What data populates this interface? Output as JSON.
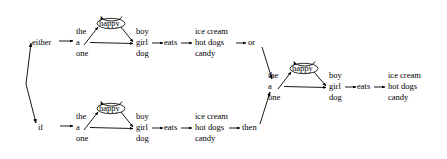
{
  "diagram": {
    "background_color": "#ffffff",
    "line_color": "#000000",
    "text_color": "#000000"
  },
  "nodes": {
    "either": {
      "label": "either"
    },
    "if": {
      "label": "if"
    },
    "branch1_det": {
      "words": [
        "the",
        "a",
        "one"
      ]
    },
    "branch1_adj": {
      "label": "happy"
    },
    "branch1_noun": {
      "words": [
        "boy",
        "girl",
        "dog"
      ]
    },
    "branch1_verb": {
      "label": "eats"
    },
    "branch1_obj": {
      "words": [
        "ice cream",
        "hot dogs",
        "candy"
      ]
    },
    "or": {
      "label": "or"
    },
    "branch2_det": {
      "words": [
        "the",
        "a",
        "one"
      ]
    },
    "branch2_adj": {
      "label": "happy"
    },
    "branch2_noun": {
      "words": [
        "boy",
        "girl",
        "dog"
      ]
    },
    "branch2_verb": {
      "label": "eats"
    },
    "branch2_obj": {
      "words": [
        "ice cream",
        "hot dogs",
        "candy"
      ]
    },
    "then": {
      "label": "then"
    },
    "branch3_det": {
      "words": [
        "the",
        "a",
        "one"
      ]
    },
    "branch3_adj": {
      "label": "happy"
    },
    "branch3_noun": {
      "words": [
        "boy",
        "girl",
        "dog"
      ]
    },
    "branch3_verb": {
      "label": "eats"
    },
    "branch3_obj": {
      "words": [
        "ice cream",
        "hot dogs",
        "candy"
      ]
    }
  }
}
